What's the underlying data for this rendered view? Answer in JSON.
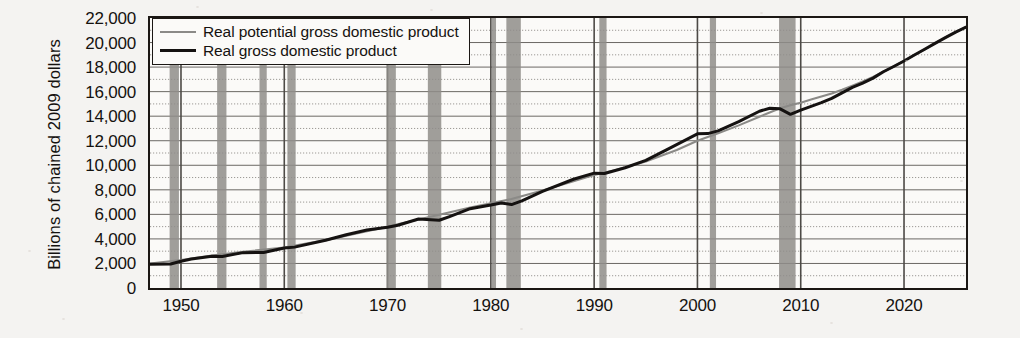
{
  "chart_data": {
    "type": "line",
    "title": "",
    "xlabel": "",
    "ylabel": "Billions of chained 2009 dollars",
    "xlim": [
      1947,
      2026
    ],
    "ylim": [
      0,
      22000
    ],
    "grid": true,
    "grid_major_step": 2000,
    "grid_minor_step": 1000,
    "legend_position": "top-left",
    "ytick_labels": [
      "22,000",
      "20,000",
      "18,000",
      "16,000",
      "14,000",
      "12,000",
      "10,000",
      "8,000",
      "6,000",
      "4,000",
      "2,000",
      "0"
    ],
    "ytick_values": [
      22000,
      20000,
      18000,
      16000,
      14000,
      12000,
      10000,
      8000,
      6000,
      4000,
      2000,
      0
    ],
    "xtick_labels": [
      "1950",
      "1960",
      "1970",
      "1980",
      "1990",
      "2000",
      "2010",
      "2020"
    ],
    "xtick_values": [
      1950,
      1960,
      1970,
      1980,
      1990,
      2000,
      2010,
      2020
    ],
    "series": [
      {
        "name": "Real potential gross domestic product",
        "color": "#8b8a87",
        "width": 2.1,
        "x": [
          1947,
          1950,
          1953,
          1956,
          1960,
          1964,
          1968,
          1970,
          1973,
          1975,
          1978,
          1980,
          1982,
          1985,
          1988,
          1990,
          1992,
          1995,
          1998,
          2000,
          2002,
          2004,
          2006,
          2008,
          2009,
          2010,
          2011,
          2012,
          2013,
          2014,
          2015,
          2016,
          2017,
          2018,
          2019,
          2020,
          2021,
          2022,
          2023,
          2024,
          2025,
          2026
        ],
        "y": [
          1990,
          2280,
          2640,
          2950,
          3300,
          3900,
          4620,
          5000,
          5580,
          5960,
          6560,
          6900,
          7250,
          7950,
          8700,
          9200,
          9600,
          10300,
          11250,
          12000,
          12600,
          13250,
          13950,
          14650,
          14900,
          15100,
          15350,
          15600,
          15850,
          16150,
          16480,
          16820,
          17200,
          17620,
          18050,
          18500,
          18980,
          19450,
          19930,
          20400,
          20850,
          21250
        ]
      },
      {
        "name": "Real gross domestic product",
        "color": "#151211",
        "width": 3.0,
        "x": [
          1947,
          1949,
          1950,
          1951,
          1953,
          1954,
          1956,
          1958,
          1960,
          1961,
          1964,
          1966,
          1968,
          1970,
          1971,
          1973,
          1975,
          1976,
          1978,
          1980,
          1981,
          1982,
          1983,
          1985,
          1988,
          1990,
          1991,
          1993,
          1995,
          1997,
          2000,
          2001,
          2002,
          2004,
          2006,
          2007,
          2008,
          2009,
          2010,
          2011,
          2012,
          2013,
          2014,
          2015,
          2016,
          2017,
          2018,
          2019,
          2020,
          2021,
          2022,
          2023,
          2024,
          2025,
          2026
        ],
        "y": [
          1930,
          1960,
          2180,
          2360,
          2580,
          2560,
          2880,
          2900,
          3260,
          3330,
          3890,
          4340,
          4730,
          4950,
          5110,
          5620,
          5520,
          5820,
          6460,
          6760,
          6930,
          6800,
          7100,
          7870,
          8860,
          9360,
          9330,
          9800,
          10400,
          11250,
          12560,
          12580,
          12800,
          13550,
          14400,
          14650,
          14600,
          14150,
          14500,
          14800,
          15100,
          15450,
          15900,
          16350,
          16700,
          17100,
          17620,
          18050,
          18500,
          18980,
          19450,
          19930,
          20400,
          20850,
          21250
        ]
      }
    ],
    "recession_bands": [
      {
        "start": 1948.9,
        "end": 1949.8
      },
      {
        "start": 1953.5,
        "end": 1954.4
      },
      {
        "start": 1957.6,
        "end": 1958.3
      },
      {
        "start": 1960.3,
        "end": 1961.1
      },
      {
        "start": 1969.9,
        "end": 1970.8
      },
      {
        "start": 1973.9,
        "end": 1975.2
      },
      {
        "start": 1980.1,
        "end": 1980.5
      },
      {
        "start": 1981.5,
        "end": 1982.9
      },
      {
        "start": 1990.5,
        "end": 1991.2
      },
      {
        "start": 2001.2,
        "end": 2001.8
      },
      {
        "start": 2007.9,
        "end": 2009.5
      }
    ],
    "recession_band_color": "#8f8d89"
  },
  "legend": {
    "items": [
      {
        "label": "Real potential gross domestic product",
        "style": "potential"
      },
      {
        "label": "Real gross domestic product",
        "style": "actual"
      }
    ]
  }
}
